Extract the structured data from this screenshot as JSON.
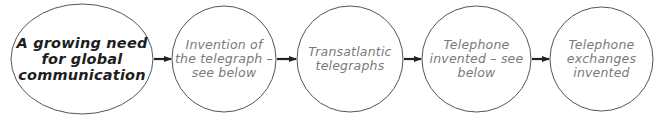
{
  "diagram": {
    "type": "flowchart",
    "direction": "left-to-right",
    "colors": {
      "stroke": "#555555",
      "arrow": "#222222",
      "primary_text": "#1e1e1e",
      "secondary_text": "#7a7a7a",
      "background": "#ffffff"
    },
    "nodes": [
      {
        "id": "need",
        "shape": "ellipse",
        "lines": [
          "A growing need",
          "for global",
          "communication"
        ]
      },
      {
        "id": "telegraph",
        "shape": "circle",
        "lines": [
          "Invention of",
          "the telegraph –",
          "see below"
        ]
      },
      {
        "id": "transatlantic",
        "shape": "circle",
        "lines": [
          "Transatlantic",
          "telegraphs"
        ]
      },
      {
        "id": "telephone",
        "shape": "circle",
        "lines": [
          "Telephone",
          "invented – see",
          "below"
        ]
      },
      {
        "id": "exchanges",
        "shape": "circle",
        "lines": [
          "Telephone",
          "exchanges",
          "invented"
        ]
      }
    ],
    "edges": [
      {
        "from": "need",
        "to": "telegraph"
      },
      {
        "from": "telegraph",
        "to": "transatlantic"
      },
      {
        "from": "transatlantic",
        "to": "telephone"
      },
      {
        "from": "telephone",
        "to": "exchanges"
      }
    ]
  }
}
